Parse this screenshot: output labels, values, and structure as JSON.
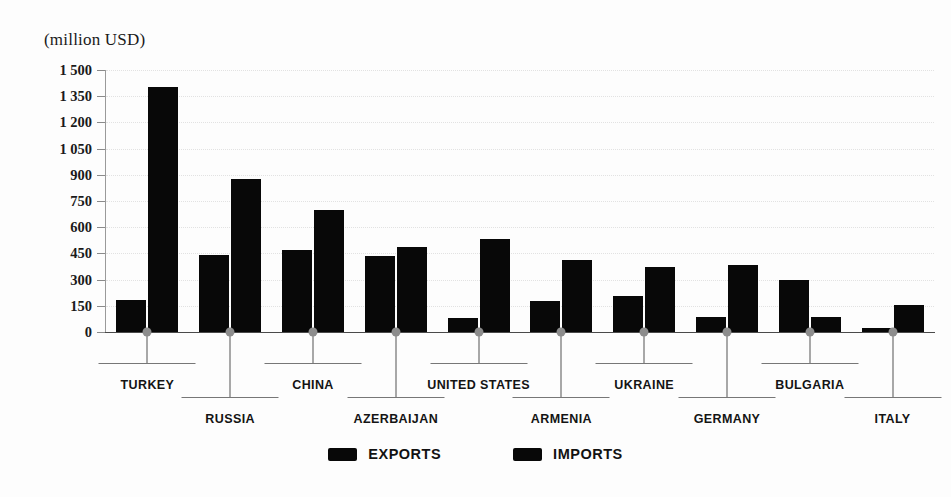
{
  "chart_data": {
    "type": "bar",
    "title": "",
    "subtitle": "",
    "unit_label": "(million USD)",
    "xlabel": "",
    "ylabel": "",
    "ylim": [
      0,
      1500
    ],
    "grid": true,
    "legend_position": "bottom-center",
    "y_ticks": [
      0,
      150,
      300,
      450,
      600,
      750,
      900,
      1050,
      1200,
      1350,
      1500
    ],
    "y_tick_labels": [
      "0",
      "150",
      "300",
      "450",
      "600",
      "750",
      "900",
      "1 050",
      "1 200",
      "1 350",
      "1 500"
    ],
    "categories": [
      "TURKEY",
      "RUSSIA",
      "CHINA",
      "AZERBAIJAN",
      "UNITED STATES",
      "ARMENIA",
      "UKRAINE",
      "GERMANY",
      "BULGARIA",
      "ITALY"
    ],
    "series": [
      {
        "name": "EXPORTS",
        "color": "#080808",
        "values": [
          185,
          440,
          470,
          435,
          80,
          180,
          205,
          85,
          295,
          25
        ]
      },
      {
        "name": "IMPORTS",
        "color": "#080808",
        "values": [
          1405,
          875,
          700,
          485,
          530,
          410,
          375,
          385,
          85,
          155
        ]
      }
    ]
  },
  "legend": {
    "items": [
      {
        "label": "EXPORTS",
        "color": "#080808"
      },
      {
        "label": "IMPORTS",
        "color": "#080808"
      }
    ]
  }
}
